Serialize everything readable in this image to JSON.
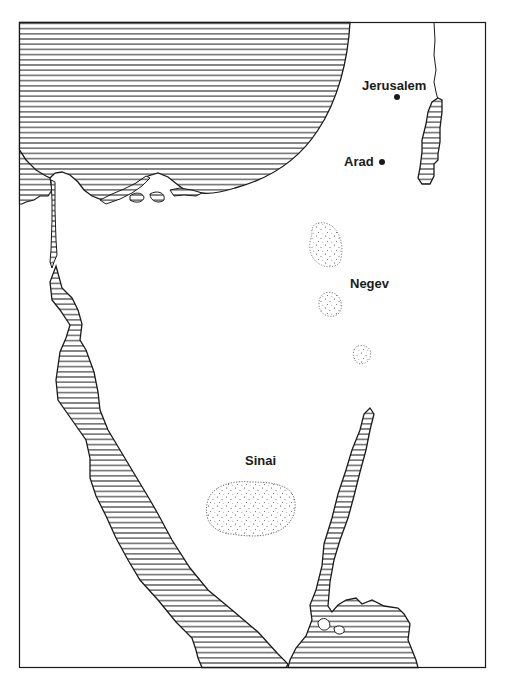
{
  "map": {
    "labels": {
      "jerusalem": "Jerusalem",
      "arad": "Arad",
      "negev": "Negev",
      "sinai": "Sinai"
    },
    "cities": [
      {
        "name": "Jerusalem",
        "marker": "dot"
      },
      {
        "name": "Arad",
        "marker": "dot"
      }
    ],
    "regions": [
      "Negev",
      "Sinai"
    ],
    "legend": {
      "water_pattern": "horizontal-hatching",
      "desert_pattern": "stippled-dots"
    },
    "colors": {
      "ink": "#1a1a1a",
      "paper": "#ffffff"
    },
    "caption_truncated": "· · ·"
  }
}
